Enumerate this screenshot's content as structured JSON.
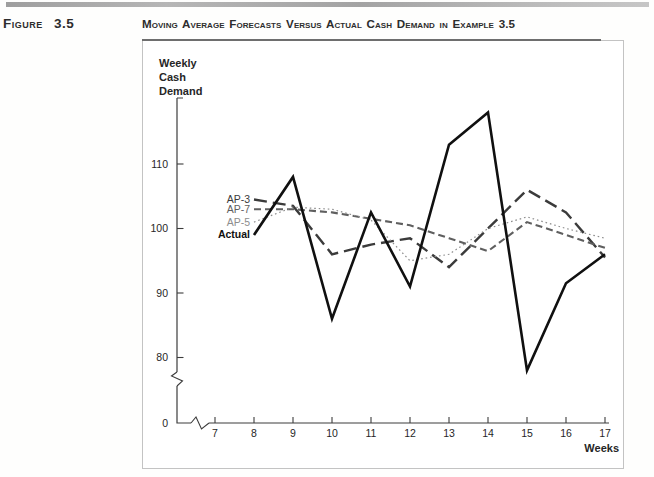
{
  "figure_label": "Figure 3.5",
  "title": "Moving Average Forecasts Versus Actual Cash Demand in Example 3.5",
  "chart_data": {
    "type": "line",
    "title": "Moving Average Forecasts Versus Actual Cash Demand in Example 3.5",
    "xlabel": "Weeks",
    "ylabel": "Weekly Cash Demand",
    "ylabel_lines": [
      "Weekly",
      "Cash",
      "Demand"
    ],
    "x": [
      8,
      9,
      10,
      11,
      12,
      13,
      14,
      15,
      16,
      17
    ],
    "x_ticks": [
      7,
      8,
      9,
      10,
      11,
      12,
      13,
      14,
      15,
      16,
      17
    ],
    "y_ticks": [
      0,
      80,
      90,
      100,
      110
    ],
    "ylim": [
      76,
      119
    ],
    "grid": false,
    "axis_break_x": true,
    "axis_break_y": true,
    "legend_position": "inline-left-of-series-start",
    "series": [
      {
        "name": "AP-3",
        "style": "long-dash",
        "color": "#3b3b3b",
        "values": [
          104.5,
          103.5,
          96,
          97.5,
          98.5,
          94,
          100,
          106,
          102.5,
          95.5
        ]
      },
      {
        "name": "AP-7",
        "style": "dash",
        "color": "#5f5f5f",
        "values": [
          103,
          103,
          102.5,
          101.5,
          100.5,
          98.5,
          96.5,
          101,
          99,
          97
        ]
      },
      {
        "name": "AP-5",
        "style": "dotted",
        "color": "#8d8d8d",
        "values": [
          101,
          103.3,
          103,
          101.3,
          95,
          96,
          100,
          101.8,
          100,
          98.5
        ]
      },
      {
        "name": "Actual",
        "style": "solid",
        "color": "#101010",
        "values": [
          99,
          108,
          86,
          102.5,
          91,
          113,
          118,
          78,
          91.5,
          96
        ]
      }
    ]
  }
}
